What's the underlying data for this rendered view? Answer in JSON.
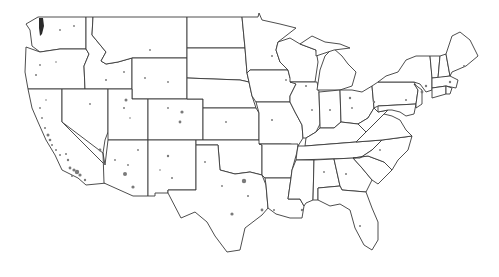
{
  "map": {
    "title": "",
    "region": "Contiguous United States",
    "style": {
      "background": "#ffffff",
      "border_color": "#3a3a3a",
      "marker_color": "#7a7a7a"
    },
    "layers": [
      "state-boundaries",
      "point-markers"
    ],
    "labels_visible": false
  }
}
